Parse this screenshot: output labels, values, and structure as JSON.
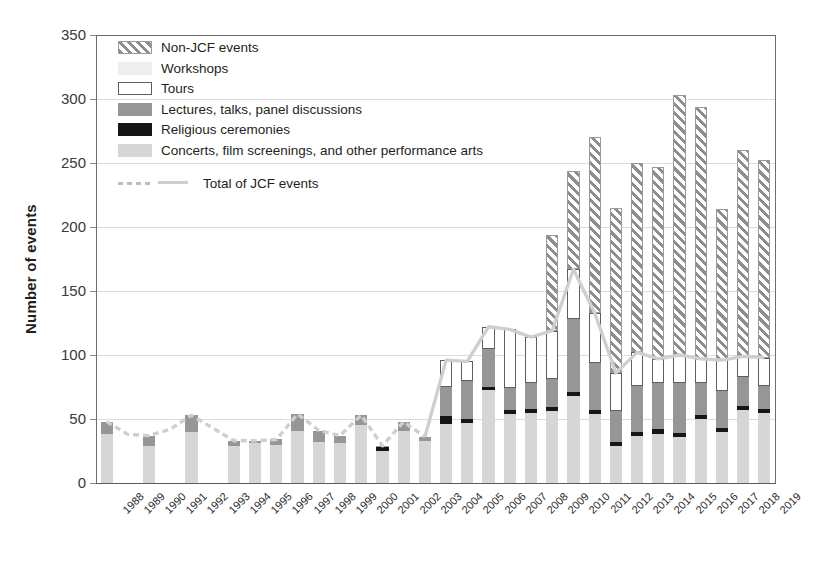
{
  "chart_data": {
    "type": "bar",
    "stacked": true,
    "title": "",
    "xlabel": "",
    "ylabel": "Number of events",
    "ylim": [
      0,
      350
    ],
    "ytick_values": [
      0,
      50,
      100,
      150,
      200,
      250,
      300,
      350
    ],
    "ytick_labels": [
      "0",
      "50",
      "100",
      "150",
      "200",
      "250",
      "300",
      "350"
    ],
    "grid": true,
    "legend_position": "top-left",
    "categories": [
      "1988",
      "1989",
      "1990",
      "1991",
      "1992",
      "1993",
      "1994",
      "1995",
      "1996",
      "1997",
      "1998",
      "1999",
      "2000",
      "2001",
      "2002",
      "2003",
      "2004",
      "2005",
      "2006",
      "2007",
      "2008",
      "2009",
      "2010",
      "2011",
      "2012",
      "2013",
      "2014",
      "2015",
      "2016",
      "2017",
      "2018",
      "2019"
    ],
    "series": [
      {
        "name": "Concerts, film screenings, and other performance arts",
        "color": "#d6d6d6",
        "values": [
          38,
          0,
          29,
          0,
          40,
          0,
          29,
          31,
          30,
          41,
          32,
          31,
          45,
          25,
          41,
          33,
          46,
          47,
          73,
          54,
          55,
          56,
          68,
          54,
          29,
          37,
          38,
          36,
          50,
          40,
          57,
          55
        ]
      },
      {
        "name": "Religious ceremonies",
        "color": "#161616",
        "values": [
          0,
          0,
          0,
          0,
          0,
          0,
          0,
          0,
          0,
          0,
          0,
          0,
          0,
          3,
          0,
          0,
          6,
          3,
          2,
          3,
          3,
          3,
          3,
          3,
          3,
          3,
          4,
          3,
          3,
          3,
          3,
          3
        ]
      },
      {
        "name": "Lectures, talks, panel discussions",
        "color": "#969696",
        "values": [
          10,
          0,
          8,
          0,
          13,
          0,
          4,
          2,
          4,
          13,
          9,
          6,
          8,
          1,
          7,
          3,
          23,
          30,
          30,
          17,
          20,
          22,
          57,
          37,
          24,
          36,
          36,
          39,
          25,
          29,
          23,
          18
        ]
      },
      {
        "name": "Tours",
        "color": "#ffffff",
        "values": [
          0,
          0,
          0,
          0,
          0,
          0,
          0,
          0,
          0,
          0,
          0,
          0,
          0,
          0,
          0,
          0,
          21,
          15,
          17,
          46,
          36,
          38,
          39,
          39,
          30,
          26,
          19,
          22,
          19,
          24,
          16,
          22
        ]
      },
      {
        "name": "Workshops",
        "color": "#eeeeee",
        "values": [
          0,
          0,
          0,
          0,
          0,
          0,
          0,
          0,
          0,
          0,
          0,
          0,
          0,
          0,
          0,
          0,
          0,
          0,
          0,
          0,
          0,
          0,
          0,
          0,
          0,
          0,
          0,
          0,
          0,
          0,
          0,
          0
        ]
      },
      {
        "name": "Non-JCF events",
        "color": "#8e8e8e",
        "hatched": true,
        "values": [
          0,
          0,
          0,
          0,
          0,
          0,
          0,
          0,
          0,
          0,
          0,
          0,
          0,
          0,
          0,
          0,
          0,
          0,
          0,
          0,
          0,
          75,
          77,
          137,
          129,
          148,
          150,
          203,
          197,
          118,
          161,
          154
        ]
      }
    ],
    "line_series": {
      "name": "Total of JCF events",
      "color": "#cfcfcf",
      "style": "dashed-then-solid",
      "dashed_until": "2003",
      "values": [
        48,
        38,
        37,
        42,
        53,
        43,
        33,
        33,
        34,
        54,
        41,
        37,
        53,
        29,
        48,
        36,
        96,
        95,
        122,
        120,
        114,
        119,
        167,
        133,
        86,
        102,
        97,
        100,
        97,
        96,
        99,
        98
      ]
    },
    "annotations": []
  },
  "legend": {
    "items": [
      {
        "label": "Non-JCF events",
        "swatch": "hatched"
      },
      {
        "label": "Workshops",
        "swatch": "workshops"
      },
      {
        "label": "Tours",
        "swatch": "tours"
      },
      {
        "label": "Lectures, talks, panel discussions",
        "swatch": "lectures"
      },
      {
        "label": "Religious ceremonies",
        "swatch": "religious"
      },
      {
        "label": "Concerts, film screenings, and other performance arts",
        "swatch": "concerts"
      }
    ],
    "line_item": {
      "label": "Total of JCF events"
    }
  }
}
